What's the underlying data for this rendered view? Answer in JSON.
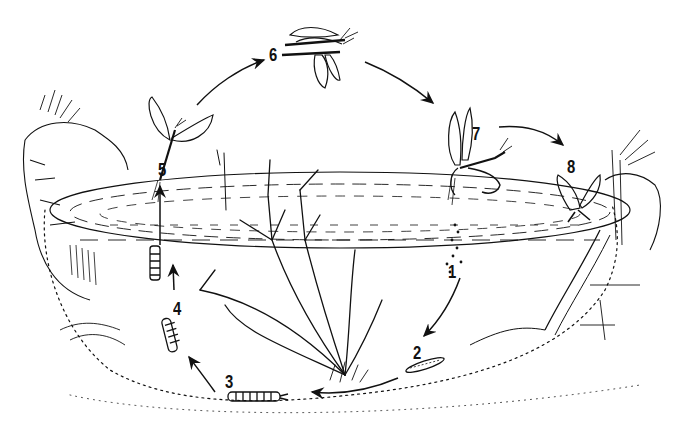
{
  "diagram": {
    "style": "black and white pen line illustration",
    "colors": {
      "ink": "#111111",
      "background": "#ffffff"
    },
    "stages": [
      {
        "id": 1,
        "label": "1",
        "depiction": "eggs sinking through water",
        "x": 448,
        "y": 262
      },
      {
        "id": 2,
        "label": "2",
        "depiction": "young nymph on pond bottom",
        "x": 413,
        "y": 343
      },
      {
        "id": 3,
        "label": "3",
        "depiction": "nymph crawling on bottom",
        "x": 225,
        "y": 372
      },
      {
        "id": 4,
        "label": "4",
        "depiction": "nymph climbing",
        "x": 173,
        "y": 299
      },
      {
        "id": 5,
        "label": "5",
        "depiction": "subimago emerging from water",
        "x": 158,
        "y": 160
      },
      {
        "id": 6,
        "label": "6",
        "depiction": "mating flight pair",
        "x": 269,
        "y": 45
      },
      {
        "id": 7,
        "label": "7",
        "depiction": "female laying eggs on water surface",
        "x": 472,
        "y": 124
      },
      {
        "id": 8,
        "label": "8",
        "depiction": "spent adult dying at pond edge",
        "x": 567,
        "y": 157
      }
    ],
    "arrows": [
      {
        "from": 1,
        "to": 2
      },
      {
        "from": 2,
        "to": 3
      },
      {
        "from": 3,
        "to": 4
      },
      {
        "from": 4,
        "to": 5
      },
      {
        "from": 5,
        "to": 6
      },
      {
        "from": 6,
        "to": 7
      },
      {
        "from": 7,
        "to": 8
      }
    ]
  }
}
